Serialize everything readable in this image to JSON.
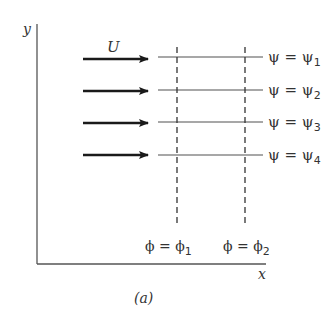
{
  "figure": {
    "caption": "(a)",
    "axes": {
      "x_label": "x",
      "y_label": "y"
    },
    "flow": {
      "velocity_label": "U",
      "arrow_count": 4
    },
    "streamlines": [
      {
        "label_lhs": "ψ = ψ",
        "subscript": "1"
      },
      {
        "label_lhs": "ψ = ψ",
        "subscript": "2"
      },
      {
        "label_lhs": "ψ = ψ",
        "subscript": "3"
      },
      {
        "label_lhs": "ψ = ψ",
        "subscript": "4"
      }
    ],
    "potential_lines": [
      {
        "label_lhs": "ϕ = ϕ",
        "subscript": "1"
      },
      {
        "label_lhs": "ϕ = ϕ",
        "subscript": "2"
      }
    ],
    "colors": {
      "axis": "#555555",
      "arrow": "#1a1a1a",
      "streamline": "#8a8a8a",
      "potential_line": "#333333",
      "text": "#333333"
    }
  }
}
